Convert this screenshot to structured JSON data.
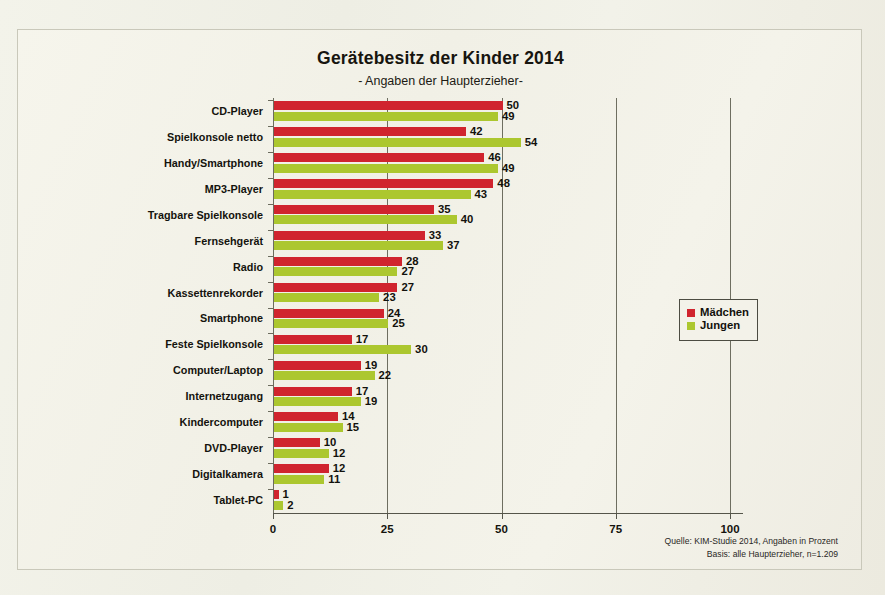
{
  "chart_data": {
    "type": "bar",
    "orientation": "horizontal",
    "title": "Gerätebesitz der Kinder 2014",
    "subtitle": "- Angaben der Haupterzieher-",
    "xlabel": "",
    "ylabel": "",
    "xlim": [
      0,
      100
    ],
    "xticks": [
      0,
      25,
      50,
      75,
      100
    ],
    "grid": true,
    "grid_axis": "x",
    "legend_position": "right",
    "categories": [
      "CD-Player",
      "Spielkonsole netto",
      "Handy/Smartphone",
      "MP3-Player",
      "Tragbare Spielkonsole",
      "Fernsehgerät",
      "Radio",
      "Kassettenrekorder",
      "Smartphone",
      "Feste Spielkonsole",
      "Computer/Laptop",
      "Internetzugang",
      "Kindercomputer",
      "DVD-Player",
      "Digitalkamera",
      "Tablet-PC"
    ],
    "series": [
      {
        "name": "Mädchen",
        "color": "#d0242e",
        "values": [
          50,
          42,
          46,
          48,
          35,
          33,
          28,
          27,
          24,
          17,
          19,
          17,
          14,
          10,
          12,
          1
        ]
      },
      {
        "name": "Jungen",
        "color": "#acc72f",
        "values": [
          49,
          54,
          49,
          43,
          40,
          37,
          27,
          23,
          25,
          30,
          22,
          19,
          15,
          12,
          11,
          2
        ]
      }
    ],
    "annotations": [
      "Quelle: KIM-Studie 2014, Angaben in Prozent",
      "Basis: alle Haupterzieher, n=1.209"
    ]
  },
  "source": {
    "line1": "Quelle: KIM-Studie 2014, Angaben in Prozent",
    "line2": "Basis: alle Haupterzieher, n=1.209"
  },
  "colors": {
    "girls": "#d0242e",
    "boys": "#acc72f",
    "paper": "#f2f1e8",
    "axis": "#55554a"
  }
}
